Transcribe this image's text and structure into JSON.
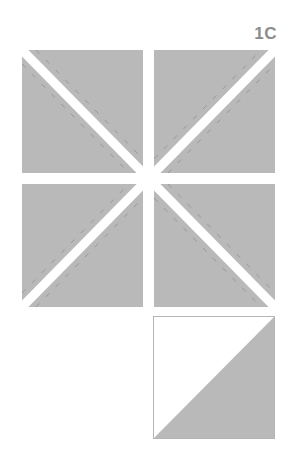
{
  "diagram": {
    "label": "1C",
    "colors": {
      "fabric": "#b9b9b9",
      "fabric_edge": "#a9a9a9",
      "seam_dash": "#8e8e8e",
      "cut_gap": "#ffffff",
      "label": "#8c8c8c",
      "outline": "#b5b5b5"
    },
    "blocks": [
      {
        "name": "top-left-square",
        "diagonal": "tl-br"
      },
      {
        "name": "top-right-square",
        "diagonal": "bl-tr"
      },
      {
        "name": "bottom-left-square",
        "diagonal": "bl-tr"
      },
      {
        "name": "bottom-right-square",
        "diagonal": "tl-br"
      }
    ],
    "result": {
      "name": "half-square-triangle-unit",
      "top_left": "white",
      "bottom_right": "gray"
    }
  }
}
